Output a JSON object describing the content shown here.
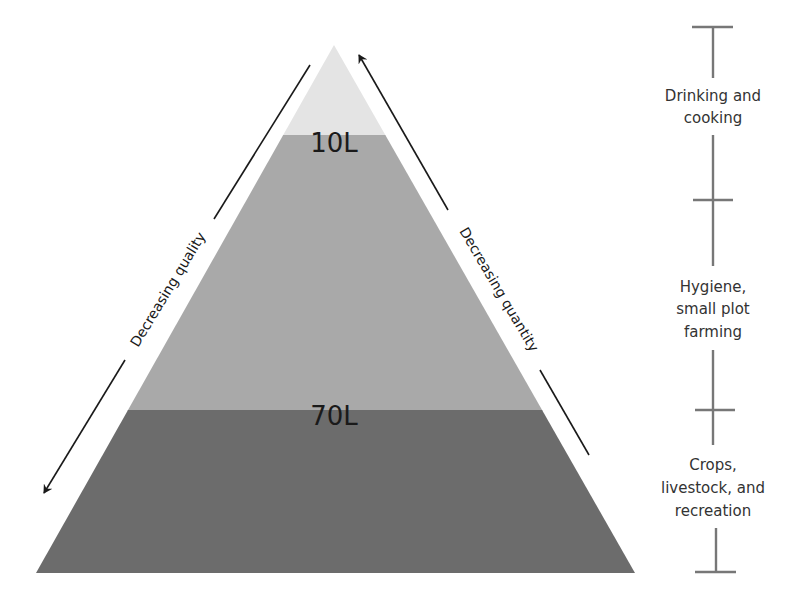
{
  "diagram": {
    "type": "pyramid",
    "bands": [
      {
        "label": "",
        "position": "top",
        "color": "#e4e4e4"
      },
      {
        "label": "10L",
        "position": "middle",
        "color": "#a9a9a9"
      },
      {
        "label": "70L",
        "position": "bottom",
        "color": "#6c6c6c"
      }
    ],
    "arrows": {
      "left": {
        "label": "Decreasing quality",
        "direction": "down"
      },
      "right": {
        "label": "Decreasing quantity",
        "direction": "up"
      }
    },
    "scale": {
      "segments": [
        {
          "lines": [
            "Drinking and",
            "cooking"
          ]
        },
        {
          "lines": [
            "Hygiene,",
            "small plot",
            "farming"
          ]
        },
        {
          "lines": [
            "Crops,",
            "livestock, and",
            "recreation"
          ]
        }
      ]
    }
  }
}
